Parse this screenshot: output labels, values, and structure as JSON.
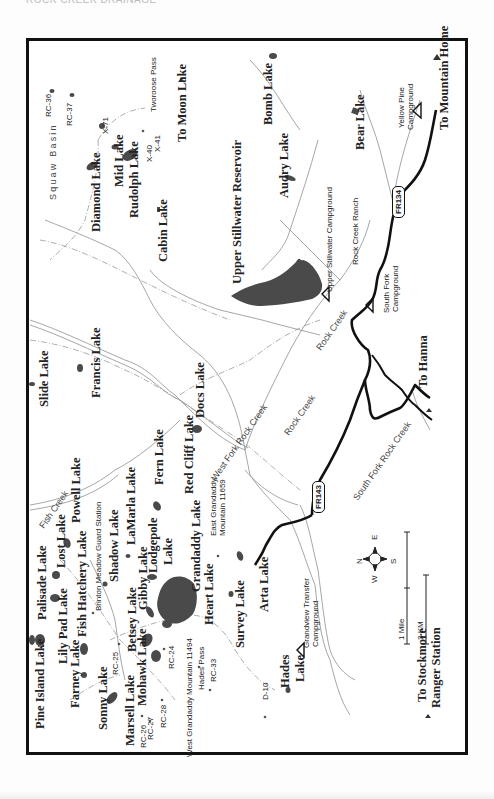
{
  "page": {
    "header_text": "ROCK CREEK DRAINAGE"
  },
  "colors": {
    "lake_fill": "#4a4a4a",
    "road": "#111111",
    "stream": "#8a8a8a",
    "trail": "#9a9a9a",
    "frame": "#111111"
  },
  "lakes_labels": [
    {
      "name": "Bomb Lake",
      "x": 262,
      "y": 125,
      "size": "big"
    },
    {
      "name": "Bear Lake",
      "x": 354,
      "y": 150,
      "size": "big"
    },
    {
      "name": "Audry Lake",
      "x": 278,
      "y": 198,
      "size": "big"
    },
    {
      "name": "Diamond Lake",
      "x": 90,
      "y": 232,
      "size": "big"
    },
    {
      "name": "Mid Lake",
      "x": 113,
      "y": 187,
      "size": "big"
    },
    {
      "name": "Rudolph Lake",
      "x": 128,
      "y": 218,
      "size": "big"
    },
    {
      "name": "Cabin Lake",
      "x": 157,
      "y": 262,
      "size": "big"
    },
    {
      "name": "Upper Stillwater Reservoir",
      "x": 231,
      "y": 284,
      "size": "big"
    },
    {
      "name": "Slide Lake",
      "x": 38,
      "y": 407,
      "size": "big"
    },
    {
      "name": "Francis Lake",
      "x": 90,
      "y": 398,
      "size": "big"
    },
    {
      "name": "Docs Lake",
      "x": 194,
      "y": 418,
      "size": "big"
    },
    {
      "name": "Red Cliff Lake",
      "x": 183,
      "y": 494,
      "size": "big"
    },
    {
      "name": "Fern Lake",
      "x": 153,
      "y": 485,
      "size": "big"
    },
    {
      "name": "Powell Lake",
      "x": 70,
      "y": 523,
      "size": "big"
    },
    {
      "name": "Lost Lake",
      "x": 55,
      "y": 568,
      "size": "big"
    },
    {
      "name": "LaMarla Lake",
      "x": 125,
      "y": 545,
      "size": "big"
    },
    {
      "name": "Shadow Lake",
      "x": 108,
      "y": 582,
      "size": "big"
    },
    {
      "name": "Lodgepole",
      "x": 147,
      "y": 573,
      "size": "big"
    },
    {
      "name": "Lake",
      "x": 162,
      "y": 565,
      "size": "big"
    },
    {
      "name": "Grandaddy Lake",
      "x": 190,
      "y": 592,
      "size": "big"
    },
    {
      "name": "Palisade Lake",
      "x": 36,
      "y": 620,
      "size": "big"
    },
    {
      "name": "Fish Hatchery Lake",
      "x": 76,
      "y": 637,
      "size": "big"
    },
    {
      "name": "Gibby Lake",
      "x": 137,
      "y": 610,
      "size": "big"
    },
    {
      "name": "Heart Lake",
      "x": 203,
      "y": 625,
      "size": "big"
    },
    {
      "name": "Lily Pad Lake",
      "x": 57,
      "y": 664,
      "size": "big"
    },
    {
      "name": "Betsey Lake",
      "x": 126,
      "y": 652,
      "size": "big"
    },
    {
      "name": "Survey Lake",
      "x": 234,
      "y": 648,
      "size": "big"
    },
    {
      "name": "Arta Lake",
      "x": 258,
      "y": 612,
      "size": "big"
    },
    {
      "name": "Pine Island Lake",
      "x": 34,
      "y": 729,
      "size": "big"
    },
    {
      "name": "Farney Lake",
      "x": 69,
      "y": 708,
      "size": "big"
    },
    {
      "name": "Mohawk Lake",
      "x": 136,
      "y": 706,
      "size": "big"
    },
    {
      "name": "Sonny Lake",
      "x": 97,
      "y": 730,
      "size": "big"
    },
    {
      "name": "Marsell Lake",
      "x": 124,
      "y": 746,
      "size": "big"
    },
    {
      "name": "Hades",
      "x": 279,
      "y": 688,
      "size": "big"
    },
    {
      "name": "Lake",
      "x": 294,
      "y": 682,
      "size": "big"
    }
  ],
  "place_labels": [
    {
      "name": "To Mountain Home",
      "x": 438,
      "y": 130,
      "size": "big"
    },
    {
      "name": "To Moon Lake",
      "x": 176,
      "y": 142,
      "size": "big"
    },
    {
      "name": "To Hanna",
      "x": 417,
      "y": 388,
      "size": "big"
    },
    {
      "name": "To Stockmore",
      "x": 416,
      "y": 702,
      "size": "big"
    },
    {
      "name": "Ranger Station",
      "x": 430,
      "y": 708,
      "size": "big"
    },
    {
      "name": "X-71",
      "x": 102,
      "y": 134,
      "size": "small"
    },
    {
      "name": "X-40",
      "x": 146,
      "y": 162,
      "size": "small"
    },
    {
      "name": "X-41",
      "x": 154,
      "y": 152,
      "size": "small"
    },
    {
      "name": "RC-36",
      "x": 45,
      "y": 117,
      "size": "small"
    },
    {
      "name": "RC-37",
      "x": 66,
      "y": 126,
      "size": "small"
    },
    {
      "name": "Tworoose Pass",
      "x": 150,
      "y": 112,
      "size": "small"
    },
    {
      "name": "Yellow Pine",
      "x": 398,
      "y": 128,
      "size": "small"
    },
    {
      "name": "Campground",
      "x": 407,
      "y": 130,
      "size": "small"
    },
    {
      "name": "Upper Stillwater Campground",
      "x": 326,
      "y": 292,
      "size": "small"
    },
    {
      "name": "Rock Creek Ranch",
      "x": 352,
      "y": 265,
      "size": "small"
    },
    {
      "name": "South Fork",
      "x": 383,
      "y": 313,
      "size": "small"
    },
    {
      "name": "Campground",
      "x": 392,
      "y": 312,
      "size": "small"
    },
    {
      "name": "Brinton Meadow Guard Station",
      "x": 95,
      "y": 611,
      "size": "small"
    },
    {
      "name": "East Grandaddy",
      "x": 210,
      "y": 536,
      "size": "small"
    },
    {
      "name": "Mountain 11659",
      "x": 219,
      "y": 536,
      "size": "small"
    },
    {
      "name": "West Grandaddy Mountain 11494",
      "x": 186,
      "y": 757,
      "size": "small"
    },
    {
      "name": "Hades Pass",
      "x": 198,
      "y": 690,
      "size": "small"
    },
    {
      "name": "RC-25",
      "x": 112,
      "y": 675,
      "size": "small"
    },
    {
      "name": "RC-24",
      "x": 168,
      "y": 669,
      "size": "small"
    },
    {
      "name": "RC-26",
      "x": 140,
      "y": 748,
      "size": "small"
    },
    {
      "name": "RC-27",
      "x": 147,
      "y": 740,
      "size": "small"
    },
    {
      "name": "RC-28",
      "x": 160,
      "y": 728,
      "size": "small"
    },
    {
      "name": "RC-33",
      "x": 210,
      "y": 682,
      "size": "small"
    },
    {
      "name": "D-10",
      "x": 262,
      "y": 700,
      "size": "small"
    },
    {
      "name": "Grandview Transfer",
      "x": 303,
      "y": 648,
      "size": "small"
    },
    {
      "name": "Campground",
      "x": 312,
      "y": 647,
      "size": "small"
    }
  ],
  "water_labels": [
    {
      "name": "Squaw Basin",
      "x": 49,
      "y": 200
    },
    {
      "name": "Rock Creek",
      "x": 315,
      "y": 347
    },
    {
      "name": "Rock Creek",
      "x": 283,
      "y": 432
    },
    {
      "name": "West Fork Rock Creek",
      "x": 210,
      "y": 477
    },
    {
      "name": "South Fork Rock Creek",
      "x": 352,
      "y": 497
    },
    {
      "name": "Fish Creek",
      "x": 38,
      "y": 525
    }
  ],
  "road_shields": [
    {
      "label": "FR134",
      "x": 392,
      "y": 218
    },
    {
      "label": "FR143",
      "x": 312,
      "y": 513
    }
  ],
  "legend": {
    "compass": {
      "n": "N",
      "e": "E",
      "s": "S",
      "w": "W"
    },
    "scale_mile": "1 Mile",
    "scale_km": "2 KM"
  }
}
